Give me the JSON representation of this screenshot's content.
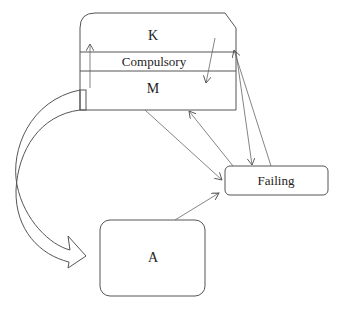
{
  "diagram": {
    "nodes": {
      "top_box": {
        "sections": [
          {
            "id": "k",
            "label": "K"
          },
          {
            "id": "compulsory",
            "label": "Compulsory"
          },
          {
            "id": "m",
            "label": "M"
          }
        ]
      },
      "failing": {
        "label": "Failing"
      },
      "a": {
        "label": "A"
      }
    },
    "edges": [
      {
        "from": "M",
        "to": "K",
        "type": "internal-arrow-up"
      },
      {
        "from": "K",
        "to": "M",
        "type": "internal-arrow-down"
      },
      {
        "from": "M",
        "to": "Failing"
      },
      {
        "from": "Failing",
        "to": "M"
      },
      {
        "from": "Compulsory",
        "to": "Failing"
      },
      {
        "from": "Failing",
        "to": "Compulsory"
      },
      {
        "from": "A",
        "to": "Failing"
      },
      {
        "from": "M",
        "to": "A",
        "type": "curved-block-arrow"
      }
    ],
    "colors": {
      "stroke": "#555555",
      "background": "#ffffff"
    }
  }
}
